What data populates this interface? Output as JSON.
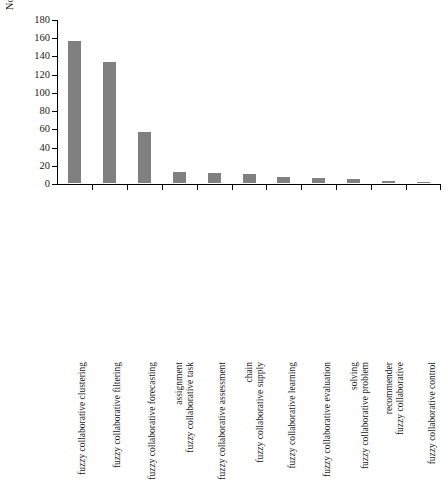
{
  "chart_data": {
    "type": "bar",
    "title": "",
    "xlabel": "",
    "ylabel": "No. of references",
    "ylim": [
      0,
      180
    ],
    "yticks": [
      0,
      20,
      40,
      60,
      80,
      100,
      120,
      140,
      160,
      180
    ],
    "grid": false,
    "legend": null,
    "bar_color": "#808080",
    "axis_color": "#000000",
    "categories": [
      "fuzzy collaborative clustering",
      "fuzzy collaborative filtering",
      "fuzzy collaborative forecasting",
      "fuzzy collaborative task assignment",
      "fuzzy collaborative assessment",
      "fuzzy collaborative supply chain",
      "fuzzy collaborative learning",
      "fuzzy collaborative evaluation",
      "fuzzy collaborative problem solving",
      "fuzzy collaborative recommender",
      "fuzzy collaborative control"
    ],
    "category_lines": [
      [
        "fuzzy collaborative clustering"
      ],
      [
        "fuzzy collaborative filtering"
      ],
      [
        "fuzzy collaborative forecasting"
      ],
      [
        "fuzzy collaborative task",
        "assignment"
      ],
      [
        "fuzzy collaborative assessment"
      ],
      [
        "fuzzy collaborative supply",
        "chain"
      ],
      [
        "fuzzy collaborative learning"
      ],
      [
        "fuzzy collaborative evaluation"
      ],
      [
        "fuzzy collaborative problem",
        "solving"
      ],
      [
        "fuzzy collaborative",
        "recommender"
      ],
      [
        "fuzzy collaborative control"
      ]
    ],
    "values": [
      156,
      133,
      56,
      12,
      11,
      10,
      7,
      5,
      4,
      2,
      1
    ]
  },
  "axis": {
    "y_tick_labels": [
      "0",
      "20",
      "40",
      "60",
      "80",
      "100",
      "120",
      "140",
      "160",
      "180"
    ],
    "y_title": "No. of references"
  }
}
